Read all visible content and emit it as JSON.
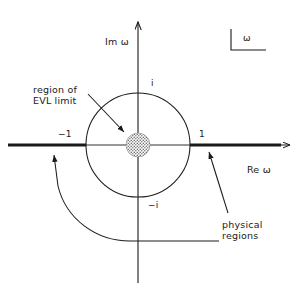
{
  "figure": {
    "title_key": "ω",
    "axes": {
      "imaginary_label": "Im ω",
      "real_label": "Re ω"
    },
    "tick_labels": {
      "minus_one": "−1",
      "one": "1",
      "plus_i": "i",
      "minus_i": "−i"
    },
    "annotations": {
      "region_line1": "region of",
      "region_line2": "EVL limit",
      "physical_line1": "physical",
      "physical_line2": "regions"
    },
    "colors": {
      "ink": "#1a1a1a",
      "background": "#ffffff",
      "stipple": "#7d7d7d"
    },
    "geometry": {
      "origin_x": 138,
      "origin_y": 145,
      "unit_circle_radius": 52,
      "evl_region_radius": 12
    }
  }
}
